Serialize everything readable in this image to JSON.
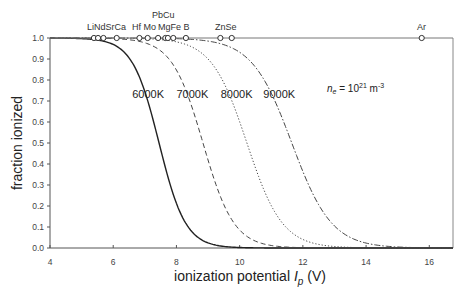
{
  "chart_data": {
    "type": "line",
    "title": "",
    "xlabel": "ionization potential I_p (V)",
    "xlabel_parts": {
      "pre": "ionization potential ",
      "italic": "I",
      "sub": "p",
      "post": " (V)"
    },
    "ylabel": "fraction ionized",
    "xlim": [
      4,
      16.75
    ],
    "ylim": [
      0.0,
      1.0
    ],
    "x_ticks": [
      4,
      6,
      8,
      10,
      12,
      14,
      16
    ],
    "x_tick_labels": [
      "4",
      "6",
      "8",
      "10",
      "12",
      "14",
      "16"
    ],
    "y_ticks": [
      0.0,
      0.1,
      0.2,
      0.3,
      0.4,
      0.5,
      0.6,
      0.7,
      0.8,
      0.9,
      1.0
    ],
    "y_tick_labels": [
      "0.0",
      "0.1",
      "0.2",
      "0.3",
      "0.4",
      "0.5",
      "0.6",
      "0.7",
      "0.8",
      "0.9",
      "1.0"
    ],
    "grid": false,
    "legend": "none (curves labeled inline)",
    "annotation": {
      "text_pre": "n",
      "text_sub": "e",
      "text_mid": " = 10",
      "text_sup": "21",
      "text_post": " m",
      "text_sup2": "-3",
      "x": 11.9,
      "y": 0.75
    },
    "series": [
      {
        "name": "6000K",
        "label": "6000K",
        "style": "solid",
        "I_half": 7.45,
        "width": 0.42,
        "label_x": 6.6,
        "label_y": 0.735,
        "x": [
          4,
          5,
          5.5,
          6,
          6.5,
          7,
          7.45,
          8,
          8.5,
          9,
          9.5,
          10,
          11,
          12,
          14,
          16.75
        ],
        "values": [
          1.0,
          1.0,
          0.99,
          0.97,
          0.91,
          0.74,
          0.5,
          0.21,
          0.07,
          0.02,
          0.01,
          0.0,
          0.0,
          0.0,
          0.0,
          0.0
        ]
      },
      {
        "name": "7000K",
        "label": "7000K",
        "style": "dashed",
        "I_half": 8.84,
        "width": 0.49,
        "label_x": 8.0,
        "label_y": 0.735,
        "x": [
          4,
          6,
          7,
          7.5,
          8,
          8.5,
          8.84,
          9.5,
          10,
          10.5,
          11,
          12,
          13,
          14,
          16.75
        ],
        "values": [
          1.0,
          1.0,
          0.98,
          0.94,
          0.85,
          0.67,
          0.5,
          0.21,
          0.09,
          0.03,
          0.01,
          0.0,
          0.0,
          0.0,
          0.0
        ]
      },
      {
        "name": "8000K",
        "label": "8000K",
        "style": "dotted",
        "I_half": 10.23,
        "width": 0.56,
        "label_x": 9.4,
        "label_y": 0.735,
        "x": [
          4,
          7,
          8,
          8.5,
          9,
          9.5,
          10.23,
          10.5,
          11,
          11.5,
          12,
          13,
          14,
          16.75
        ],
        "values": [
          1.0,
          1.0,
          0.98,
          0.96,
          0.9,
          0.79,
          0.5,
          0.38,
          0.2,
          0.09,
          0.04,
          0.01,
          0.0,
          0.0
        ]
      },
      {
        "name": "9000K",
        "label": "9000K",
        "style": "dash-dot",
        "I_half": 11.65,
        "width": 0.63,
        "label_x": 10.75,
        "label_y": 0.735,
        "x": [
          4,
          8,
          9,
          9.5,
          10,
          10.5,
          11,
          11.65,
          12,
          12.5,
          13,
          14,
          15,
          16.75
        ],
        "values": [
          1.0,
          1.0,
          0.99,
          0.97,
          0.93,
          0.86,
          0.74,
          0.5,
          0.37,
          0.2,
          0.1,
          0.02,
          0.0,
          0.0
        ]
      }
    ],
    "elements": [
      {
        "symbol": "Li",
        "ip": 5.39,
        "label_row": 1
      },
      {
        "symbol": "Nd",
        "ip": 5.52,
        "label_row": 1
      },
      {
        "symbol": "Sr",
        "ip": 5.69,
        "label_row": 1
      },
      {
        "symbol": "Ca",
        "ip": 6.11,
        "label_row": 1
      },
      {
        "symbol": "Hf",
        "ip": 6.83,
        "label_row": 1
      },
      {
        "symbol": "Mo",
        "ip": 7.09,
        "label_row": 1
      },
      {
        "symbol": "Pb",
        "ip": 7.42,
        "label_row": 2
      },
      {
        "symbol": "Mg",
        "ip": 7.65,
        "label_row": 1
      },
      {
        "symbol": "Cu",
        "ip": 7.73,
        "label_row": 2
      },
      {
        "symbol": "Fe",
        "ip": 7.9,
        "label_row": 1
      },
      {
        "symbol": "B",
        "ip": 8.3,
        "label_row": 1
      },
      {
        "symbol": "Zn",
        "ip": 9.39,
        "label_row": 1
      },
      {
        "symbol": "Se",
        "ip": 9.75,
        "label_row": 1
      },
      {
        "symbol": "Ar",
        "ip": 15.76,
        "label_row": 1
      }
    ],
    "element_label_groups": [
      {
        "text": "LiNdSrCa",
        "x_px": 87,
        "row": 1
      },
      {
        "text": "Hf Mo",
        "x_px": 132,
        "row": 1
      },
      {
        "text": "PbCu",
        "x_px": 152,
        "row": 2
      },
      {
        "text": "MgFe B",
        "x_px": 158,
        "row": 1
      },
      {
        "text": "ZnSe",
        "x_px": 215,
        "row": 1
      },
      {
        "text": "Ar",
        "x_px": 417,
        "row": 1
      }
    ]
  }
}
